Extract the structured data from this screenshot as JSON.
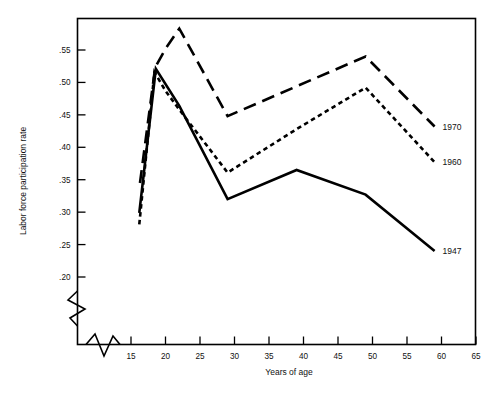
{
  "chart_data": {
    "type": "line",
    "title": "",
    "xlabel": "Years of age",
    "ylabel": "Labor force participation rate",
    "xlim": [
      14,
      65
    ],
    "ylim": [
      0.185,
      0.59
    ],
    "grid": false,
    "legend_position": "right-end-of-line",
    "axis_breaks": {
      "y_break": true,
      "x_break": true
    },
    "xticks": [
      "15",
      "20",
      "25",
      "30",
      "35",
      "40",
      "45",
      "50",
      "55",
      "60",
      "65"
    ],
    "xtick_values": [
      15,
      20,
      25,
      30,
      35,
      40,
      45,
      50,
      55,
      60,
      65
    ],
    "yticks": [
      ".20",
      ".25",
      ".30",
      ".35",
      ".40",
      ".45",
      ".50",
      ".55"
    ],
    "ytick_values": [
      0.2,
      0.25,
      0.3,
      0.35,
      0.4,
      0.45,
      0.5,
      0.55
    ],
    "series": [
      {
        "name": "1970",
        "label": "1970",
        "style": "long-dash",
        "color": "#000000",
        "x": [
          16.3,
          18.5,
          20.0,
          22.0,
          29.0,
          39.0,
          49.0,
          59.0
        ],
        "values": [
          0.345,
          0.523,
          0.552,
          0.583,
          0.448,
          0.494,
          0.54,
          0.432
        ]
      },
      {
        "name": "1960",
        "label": "1960",
        "style": "short-dash",
        "color": "#000000",
        "x": [
          16.2,
          18.4,
          20.0,
          22.0,
          29.0,
          39.0,
          49.0,
          59.0
        ],
        "values": [
          0.281,
          0.516,
          0.487,
          0.458,
          0.361,
          0.428,
          0.492,
          0.377
        ]
      },
      {
        "name": "1947",
        "label": "1947",
        "style": "solid",
        "color": "#000000",
        "x": [
          16.2,
          18.6,
          22.0,
          29.0,
          39.0,
          49.0,
          59.0
        ],
        "values": [
          0.299,
          0.521,
          0.464,
          0.32,
          0.365,
          0.327,
          0.24
        ]
      }
    ]
  },
  "figure": {
    "caption": ""
  }
}
